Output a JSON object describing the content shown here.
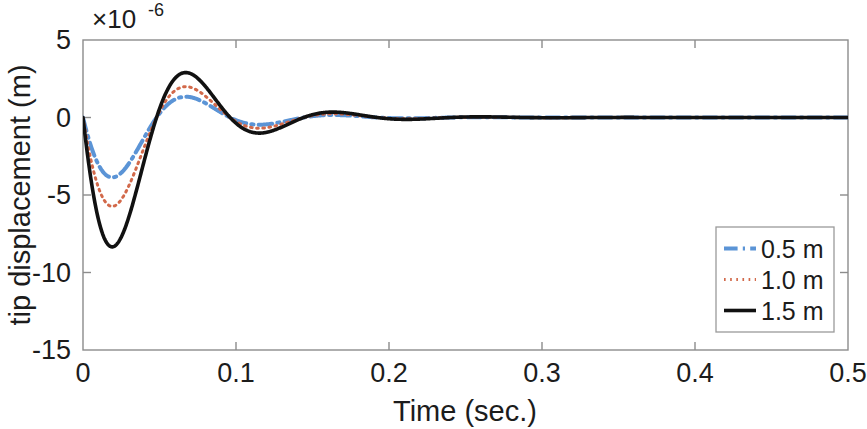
{
  "chart_data": {
    "type": "line",
    "title": "",
    "xlabel": "Time (sec.)",
    "ylabel": "tip displacement (m)",
    "y_exponent_label": "×10",
    "y_exponent_power": "-6",
    "y_scale_factor": 1e-06,
    "xlim": [
      0,
      0.5
    ],
    "ylim": [
      -15,
      5
    ],
    "xticks": [
      0,
      0.1,
      0.2,
      0.3,
      0.4,
      0.5
    ],
    "xtick_labels": [
      "0",
      "0.1",
      "0.2",
      "0.3",
      "0.4",
      "0.5"
    ],
    "yticks": [
      5,
      0,
      -5,
      -10,
      -15
    ],
    "ytick_labels": [
      "5",
      "0",
      "-5",
      "-10",
      "-15"
    ],
    "grid": false,
    "legend_position": "lower right",
    "series": [
      {
        "name": "0.5 m",
        "color": "#5b94d6",
        "linestyle": "dashdot",
        "linewidth": 4.0,
        "amplitude": 6.2,
        "decay": 22.0,
        "frequency": 10.4,
        "phase_offset": 0.0,
        "key_points": {
          "first_trough_t": 0.024,
          "first_trough_y": -5.4,
          "first_peak_t": 0.066,
          "first_peak_y": 2.4,
          "second_trough_t": 0.115,
          "second_trough_y": -1.0,
          "second_peak_t": 0.16,
          "second_peak_y": 0.55
        }
      },
      {
        "name": "1.0 m",
        "color": "#d2694a",
        "linestyle": "dotted",
        "linewidth": 3.0,
        "amplitude": 9.2,
        "decay": 22.0,
        "frequency": 10.4,
        "phase_offset": 0.0,
        "key_points": {
          "first_trough_t": 0.024,
          "first_trough_y": -8.0,
          "first_peak_t": 0.066,
          "first_peak_y": 3.8,
          "second_trough_t": 0.115,
          "second_trough_y": -1.5,
          "second_peak_t": 0.16,
          "second_peak_y": 0.8
        }
      },
      {
        "name": "1.5 m",
        "color": "#111111",
        "linestyle": "solid",
        "linewidth": 3.6,
        "amplitude": 13.4,
        "decay": 22.0,
        "frequency": 10.4,
        "phase_offset": 0.0,
        "key_points": {
          "first_trough_t": 0.024,
          "first_trough_y": -11.7,
          "first_peak_t": 0.066,
          "first_peak_y": 5.0,
          "second_trough_t": 0.115,
          "second_trough_y": -2.0,
          "second_peak_t": 0.16,
          "second_peak_y": 1.0
        }
      }
    ],
    "legend_entries": [
      {
        "label": "0.5 m",
        "color": "#5b94d6",
        "linestyle": "dashdot"
      },
      {
        "label": "1.0 m",
        "color": "#d2694a",
        "linestyle": "dotted"
      },
      {
        "label": "1.5 m",
        "color": "#111111",
        "linestyle": "solid"
      }
    ]
  }
}
